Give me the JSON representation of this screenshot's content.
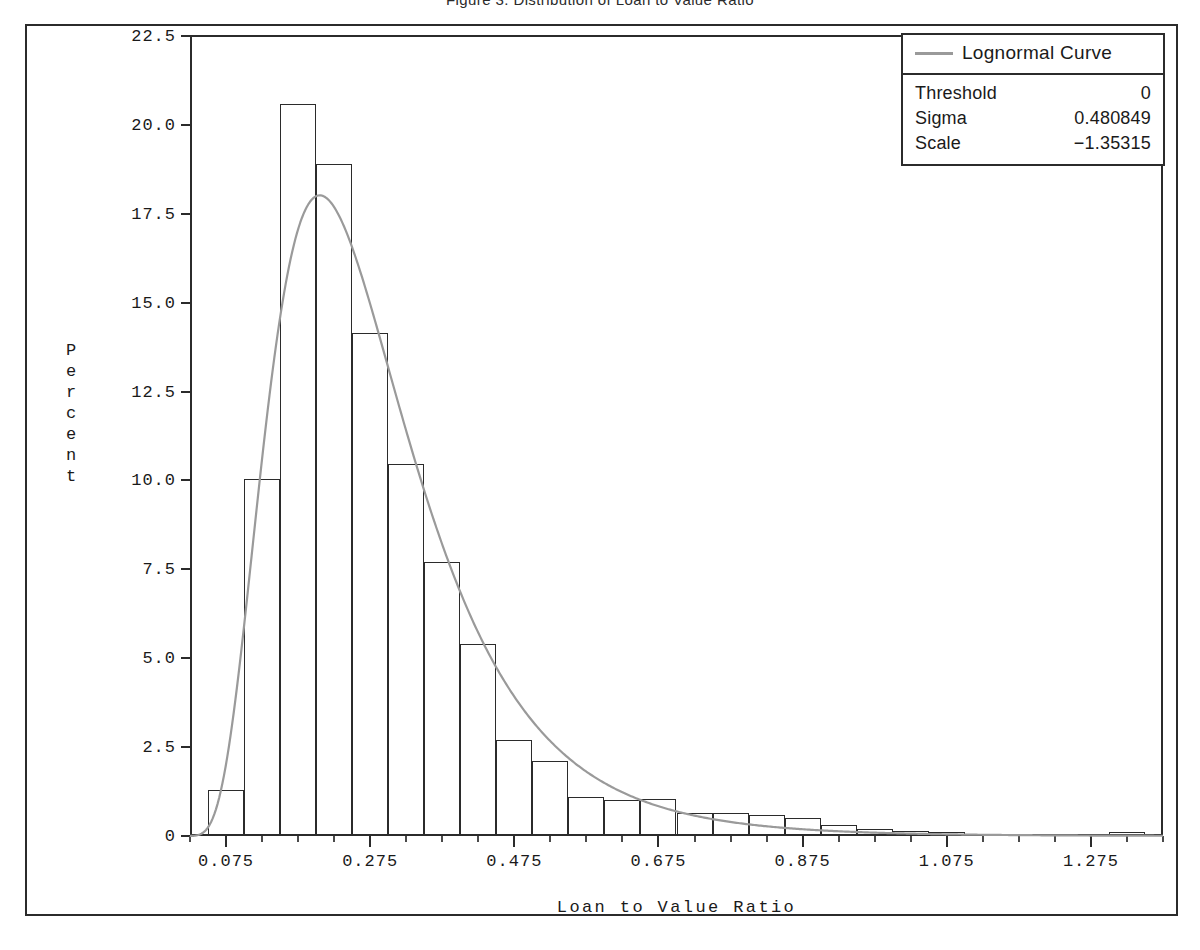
{
  "chart_data": {
    "type": "bar",
    "title": "Figure 3. Distribution of Loan to Value Ratio",
    "xlabel": "Loan to Value Ratio",
    "ylabel": "Percent",
    "grid": false,
    "xlim": [
      0.025,
      1.375
    ],
    "ylim": [
      0,
      22.5
    ],
    "bin_width": 0.05,
    "xticks": [
      "0.075",
      "0.275",
      "0.475",
      "0.675",
      "0.875",
      "1.075",
      "1.275"
    ],
    "xtick_values": [
      0.075,
      0.275,
      0.475,
      0.675,
      0.875,
      1.075,
      1.275
    ],
    "yticks": [
      "0",
      "2.5",
      "5.0",
      "7.5",
      "10.0",
      "12.5",
      "15.0",
      "17.5",
      "20.0",
      "22.5"
    ],
    "ytick_values": [
      0,
      2.5,
      5.0,
      7.5,
      10.0,
      12.5,
      15.0,
      17.5,
      20.0,
      22.5
    ],
    "categories": [
      "0.075",
      "0.125",
      "0.175",
      "0.225",
      "0.275",
      "0.325",
      "0.375",
      "0.425",
      "0.475",
      "0.525",
      "0.575",
      "0.625",
      "0.675",
      "0.725",
      "0.775",
      "0.825",
      "0.875",
      "0.925",
      "0.975",
      "1.025",
      "1.075",
      "1.125",
      "1.175",
      "1.225",
      "1.275",
      "1.325"
    ],
    "values": [
      1.3,
      10.05,
      20.6,
      18.9,
      14.15,
      10.45,
      7.7,
      5.4,
      2.7,
      2.1,
      1.1,
      1.0,
      1.05,
      0.65,
      0.65,
      0.6,
      0.5,
      0.3,
      0.2,
      0.15,
      0.1,
      0.05,
      0.05,
      0.03,
      0.0,
      0.12
    ],
    "series": [
      {
        "name": "Lognormal Curve",
        "type": "line",
        "color": "#9a9a9a",
        "distribution": "lognormal",
        "threshold": 0,
        "sigma": 0.480849,
        "scale": -1.35315,
        "bin_width": 0.05
      }
    ],
    "legend_position": "top-right"
  },
  "legend": {
    "curve_label": "Lognormal Curve",
    "params": [
      {
        "key": "Threshold",
        "value": "0"
      },
      {
        "key": "Sigma",
        "value": "0.480849"
      },
      {
        "key": "Scale",
        "value": "−1.35315"
      }
    ]
  },
  "colors": {
    "axis": "#2b2b2b",
    "bar_outline": "#2b2b2b",
    "curve": "#9a9a9a",
    "background": "#ffffff"
  }
}
